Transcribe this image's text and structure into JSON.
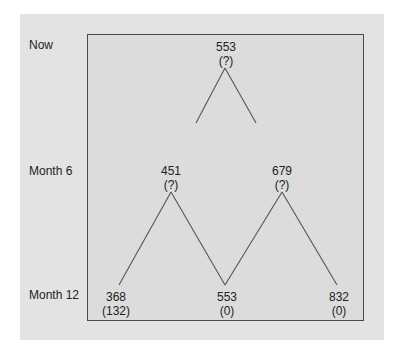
{
  "row_labels": [
    "Now",
    "Month 6",
    "Month 12"
  ],
  "nodes": {
    "root": {
      "value": "553",
      "note": "(?)"
    },
    "m6_low": {
      "value": "451",
      "note": "(?)"
    },
    "m6_high": {
      "value": "679",
      "note": "(?)"
    },
    "m12_low": {
      "value": "368",
      "note": "(132)"
    },
    "m12_mid": {
      "value": "553",
      "note": "(0)"
    },
    "m12_high": {
      "value": "832",
      "note": "(0)"
    }
  },
  "colors": {
    "panel": "#e3e3e3",
    "box_border": "#4a4a4a",
    "line": "#555555"
  }
}
